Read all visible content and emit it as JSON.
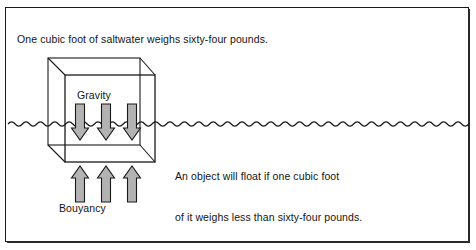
{
  "figure": {
    "background_color": "#ffffff",
    "border_color": "#1a1a1a"
  },
  "captions": {
    "top": "One cubic foot of saltwater weighs sixty-four pounds.",
    "float_line1": "An object will float if one cubic foot",
    "float_line2": "of it weighs less than sixty-four pounds."
  },
  "labels": {
    "gravity": "Gravity",
    "bouyancy": "Bouyancy"
  },
  "colors": {
    "arrow_fill": "#b3b3b3",
    "arrow_stroke": "#1a1a1a",
    "line": "#1a1a1a",
    "text": "#141414",
    "water": "#1a1a1a"
  },
  "diagram": {
    "waterline_label": "water-surface",
    "cube_label": "cubic-foot-of-water",
    "gravity_arrow_count": 3,
    "gravity_arrow_direction": "down",
    "bouyancy_arrow_count": 3,
    "bouyancy_arrow_direction": "up"
  }
}
